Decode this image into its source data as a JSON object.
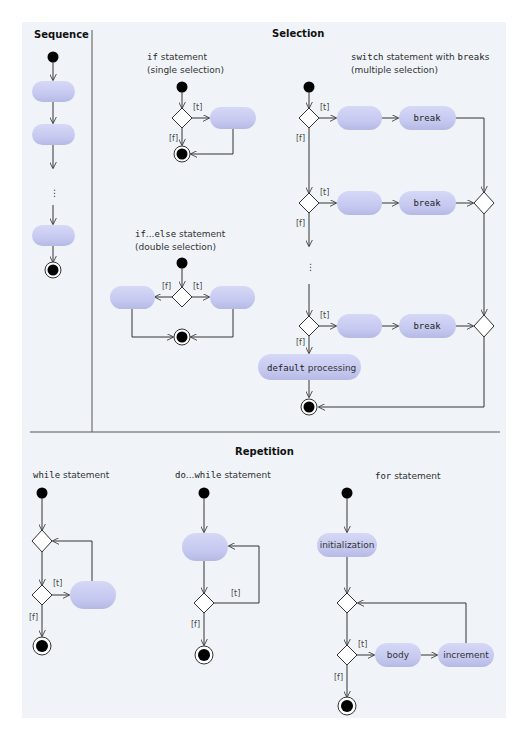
{
  "sections": {
    "sequence": {
      "title": "Sequence"
    },
    "selection": {
      "title": "Selection",
      "if": {
        "code": "if",
        "text": " statement",
        "sub": "(single selection)"
      },
      "ifelse": {
        "code1": "if",
        "dots": "...",
        "code2": "else",
        "text": " statement",
        "sub": "(double selection)"
      },
      "switch": {
        "code1": "switch",
        "text1": " statement with ",
        "code2": "break",
        "text2": "s",
        "sub": "(multiple selection)"
      },
      "break_label": "break",
      "default_code": "default",
      "default_text": " processing"
    },
    "repetition": {
      "title": "Repetition",
      "while": {
        "code": "while",
        "text": " statement"
      },
      "dowhile": {
        "code1": "do",
        "dots": "...",
        "code2": "while",
        "text": " statement"
      },
      "for": {
        "code": "for",
        "text": " statement",
        "init": "initialization",
        "body": "body",
        "increment": "increment"
      }
    }
  },
  "guards": {
    "true": "[t]",
    "false": "[f]"
  },
  "ellipsis": "⋮",
  "colors": {
    "action": "#c8cbf0",
    "background": "#f0f4f8",
    "line": "#333333"
  }
}
